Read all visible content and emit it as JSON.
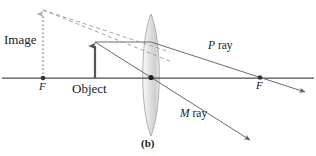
{
  "figure": {
    "panel_label": "(b)",
    "type": "converging-lens-ray-diagram",
    "labels": {
      "image": "Image",
      "object": "Object",
      "focal_point_left": "F",
      "focal_point_right": "F",
      "p_ray_prefix": "P",
      "p_ray_suffix": " ray",
      "m_ray_prefix": "M",
      "m_ray_suffix": " ray"
    },
    "colors": {
      "axis": "#4d4d4d",
      "ray": "#6b6b6b",
      "dashed_ray": "#9a9a9a",
      "object_arrow": "#555555",
      "image_dotted": "#b0b0b0",
      "lens_fill_light": "#f2f2f2",
      "lens_fill_mid": "#d9d9d9",
      "lens_outline": "#a8a8a8",
      "text": "#1a1a1a",
      "background": "#ffffff"
    },
    "geometry": {
      "axis_y": 78,
      "axis_x_start": 2,
      "axis_x_end": 314,
      "lens_center_x": 151,
      "lens_top_y": 14,
      "lens_bottom_y": 136,
      "lens_half_width": 11,
      "focal_left_x": 43,
      "focal_right_x": 260,
      "object_x": 95,
      "object_tip_y": 42,
      "image_x": 43,
      "image_tip_y": 10,
      "p_ray_end_x": 305,
      "p_ray_end_y": 92,
      "m_ray_end_x": 250,
      "m_ray_end_y": 140
    }
  }
}
